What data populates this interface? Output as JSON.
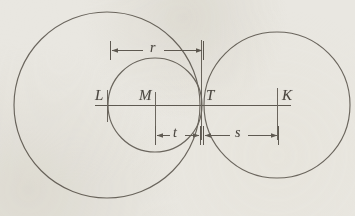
{
  "figure": {
    "kind": "geometry-diagram",
    "width": 355,
    "height": 216,
    "background_color": "#e9e7e1",
    "line_color": "#635e56",
    "text_color": "#4a4640",
    "baseline_y": 105
  },
  "circles": [
    {
      "name": "large-circle",
      "center_label": "L",
      "cx": 107,
      "cy": 105,
      "r": 93
    },
    {
      "name": "middle-circle",
      "center_label": "M",
      "cx": 155,
      "cy": 105,
      "r": 47
    },
    {
      "name": "right-circle",
      "center_label": "K",
      "cx": 277,
      "cy": 105,
      "r": 73
    }
  ],
  "points": [
    {
      "label": "L",
      "x": 107,
      "y": 105,
      "label_x": 95,
      "label_y": 88,
      "role": "center-of-large-circle"
    },
    {
      "label": "M",
      "x": 155,
      "y": 105,
      "label_x": 139,
      "label_y": 88,
      "role": "center-of-middle-circle"
    },
    {
      "label": "T",
      "x": 201,
      "y": 105,
      "label_x": 206,
      "label_y": 88,
      "role": "tangency-point"
    },
    {
      "label": "K",
      "x": 277,
      "y": 105,
      "label_x": 282,
      "label_y": 88,
      "role": "center-of-right-circle"
    }
  ],
  "baseline": {
    "name": "diameter-line",
    "x_start": 95,
    "x_end": 291,
    "y": 105
  },
  "dimensions": [
    {
      "label": "r",
      "name": "dimension-r",
      "x_start": 110,
      "x_end": 203,
      "y": 50,
      "label_x": 152,
      "label_y": 40,
      "describes": "radius of large circle, from L to T"
    },
    {
      "label": "t",
      "name": "dimension-t",
      "x_start": 155,
      "x_end": 200,
      "y": 135,
      "label_x": 173,
      "label_y": 125,
      "describes": "radius of middle circle, from M to T"
    },
    {
      "label": "s",
      "name": "dimension-s",
      "x_start": 203,
      "x_end": 278,
      "y": 135,
      "label_x": 236,
      "label_y": 125,
      "describes": "radius of right circle, from T to K"
    }
  ],
  "tick_marks": [
    {
      "name": "tick-L",
      "x": 107,
      "y_top": 90,
      "y_bottom": 122
    },
    {
      "name": "tick-M",
      "x": 155,
      "y_top": 92,
      "y_bottom": 130
    },
    {
      "name": "tick-T",
      "x": 201,
      "y_top": 40,
      "y_bottom": 140
    },
    {
      "name": "tick-K",
      "x": 277,
      "y_top": 88,
      "y_bottom": 140
    }
  ]
}
